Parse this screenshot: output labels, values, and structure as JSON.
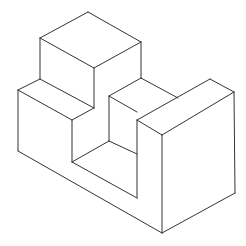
{
  "diagram": {
    "type": "isometric-line-drawing",
    "stroke_color": "#333333",
    "background": "#ffffff",
    "edges": [
      [
        88,
        12,
        40,
        38
      ],
      [
        88,
        12,
        141,
        42
      ],
      [
        40,
        38,
        94,
        68
      ],
      [
        141,
        42,
        94,
        68
      ],
      [
        40,
        38,
        40,
        79
      ],
      [
        94,
        68,
        94,
        108
      ],
      [
        141,
        42,
        141,
        78
      ],
      [
        40,
        79,
        18,
        90
      ],
      [
        40,
        79,
        94,
        108
      ],
      [
        94,
        108,
        72,
        120
      ],
      [
        18,
        90,
        72,
        120
      ],
      [
        18,
        90,
        18,
        151
      ],
      [
        72,
        120,
        72,
        162
      ],
      [
        18,
        151,
        162,
        233
      ],
      [
        162,
        233,
        235,
        193
      ],
      [
        141,
        78,
        109,
        96
      ],
      [
        141,
        78,
        178,
        98
      ],
      [
        109,
        96,
        137,
        112
      ],
      [
        109,
        96,
        109,
        141
      ],
      [
        137,
        120,
        137,
        198
      ],
      [
        137,
        120,
        162,
        135
      ],
      [
        137,
        120,
        210,
        79
      ],
      [
        210,
        79,
        234,
        92
      ],
      [
        162,
        135,
        234,
        92
      ],
      [
        234,
        92,
        235,
        193
      ],
      [
        162,
        135,
        162,
        233
      ],
      [
        72,
        162,
        137,
        198
      ],
      [
        72,
        162,
        109,
        141
      ],
      [
        109,
        141,
        137,
        154
      ]
    ]
  }
}
